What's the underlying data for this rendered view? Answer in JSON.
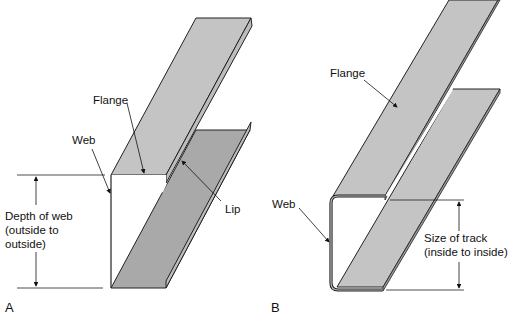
{
  "figure_a": {
    "letter": "A",
    "labels": {
      "flange": "Flange",
      "web": "Web",
      "lip": "Lip",
      "depth_line1": "Depth of web",
      "depth_line2": "(outside to",
      "depth_line3": "outside)"
    },
    "colors": {
      "flange_light": "#c4c4c4",
      "flange_dark": "#a9a9a9",
      "edge": "#222222"
    }
  },
  "figure_b": {
    "letter": "B",
    "labels": {
      "flange": "Flange",
      "web": "Web",
      "size_line1": "Size of track",
      "size_line2": "(inside to inside)"
    },
    "colors": {
      "flange": "#c4c4c4",
      "edge": "#222222"
    }
  }
}
